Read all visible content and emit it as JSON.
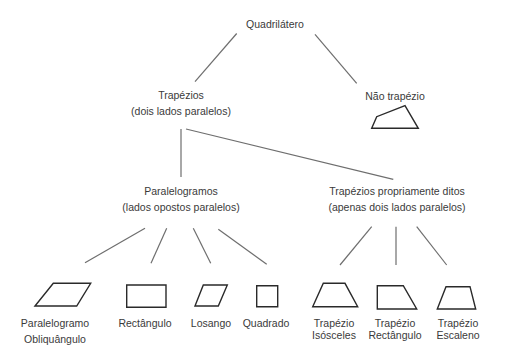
{
  "diagram": {
    "type": "tree",
    "colors": {
      "text": "#3a3a3a",
      "connector": "#6e6e6e",
      "shape_stroke": "#2a2a2a",
      "background": "#ffffff"
    },
    "nodes": {
      "root": {
        "label": "Quadrilátero"
      },
      "trapezios": {
        "label": "Trapézios",
        "sublabel": "(dois lados paralelos)"
      },
      "nao_trapezio": {
        "label": "Não trapézio",
        "shape": "irregular-quadrilateral"
      },
      "paralelogramos": {
        "label": "Paralelogramos",
        "sublabel": "(lados opostos paralelos)"
      },
      "trapezios_proprios": {
        "label": "Trapézios propriamente ditos",
        "sublabel": "(apenas dois lados paralelos)"
      },
      "leaves": [
        {
          "label": "Paralelogramo",
          "sublabel": "Obliquângulo",
          "shape": "parallelogram"
        },
        {
          "label": "Rectângulo",
          "sublabel": "",
          "shape": "rectangle"
        },
        {
          "label": "Losango",
          "sublabel": "",
          "shape": "rhombus"
        },
        {
          "label": "Quadrado",
          "sublabel": "",
          "shape": "square"
        },
        {
          "label": "Trapézio",
          "sublabel": "Isósceles",
          "shape": "isosceles-trapezoid"
        },
        {
          "label": "Trapézio",
          "sublabel": "Rectângulo",
          "shape": "right-trapezoid"
        },
        {
          "label": "Trapézio",
          "sublabel": "Escaleno",
          "shape": "scalene-trapezoid"
        }
      ]
    },
    "edges": [
      [
        "Quadrilátero",
        "Trapézios"
      ],
      [
        "Quadrilátero",
        "Não trapézio"
      ],
      [
        "Trapézios",
        "Paralelogramos"
      ],
      [
        "Trapézios",
        "Trapézios propriamente ditos"
      ],
      [
        "Paralelogramos",
        "Paralelogramo Obliquângulo"
      ],
      [
        "Paralelogramos",
        "Rectângulo"
      ],
      [
        "Paralelogramos",
        "Losango"
      ],
      [
        "Paralelogramos",
        "Quadrado"
      ],
      [
        "Trapézios propriamente ditos",
        "Trapézio Isósceles"
      ],
      [
        "Trapézios propriamente ditos",
        "Trapézio Rectângulo"
      ],
      [
        "Trapézios propriamente ditos",
        "Trapézio Escaleno"
      ]
    ]
  }
}
